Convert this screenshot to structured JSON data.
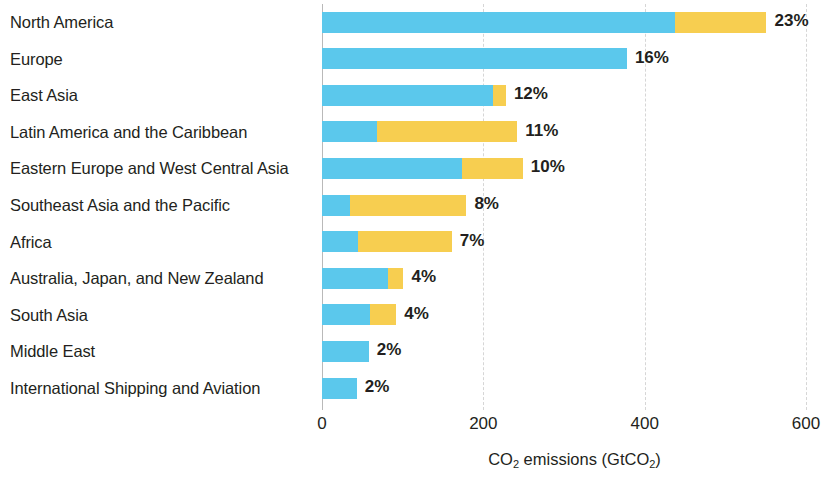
{
  "chart_data": {
    "type": "bar",
    "orientation": "horizontal",
    "stacked": true,
    "title": "",
    "xlabel": "CO2 emissions (GtCO2)",
    "xlabel_parts": {
      "pre": "CO",
      "sub1": "2",
      "mid": " emissions (GtCO",
      "sub2": "2",
      "post": ")"
    },
    "ylabel": "",
    "xlim": [
      0,
      600
    ],
    "xticks": [
      0,
      200,
      400,
      600
    ],
    "xtick_labels": [
      "0",
      "200",
      "400",
      "600"
    ],
    "grid": "vertical-dashed",
    "legend": "none",
    "categories": [
      "North America",
      "Europe",
      "East Asia",
      "Latin  America and the Caribbean",
      "Eastern Europe and West Central Asia",
      "Southeast Asia and the Pacific",
      "Africa",
      "Australia, Japan, and New Zealand",
      "South Asia",
      "Middle East",
      "International Shipping and Aviation"
    ],
    "series": [
      {
        "name": "segment-1",
        "color": "#5bc8ec",
        "values": [
          437,
          378,
          212,
          68,
          173,
          35,
          45,
          82,
          59,
          58,
          43
        ]
      },
      {
        "name": "segment-2",
        "color": "#f7ce50",
        "values": [
          114,
          0,
          16,
          174,
          76,
          144,
          116,
          19,
          33,
          0,
          0
        ]
      }
    ],
    "totals": [
      551,
      378,
      228,
      242,
      249,
      179,
      161,
      101,
      92,
      58,
      43
    ],
    "data_labels": [
      "23%",
      "16%",
      "12%",
      "11%",
      "10%",
      "8%",
      "7%",
      "4%",
      "4%",
      "2%",
      "2%"
    ]
  },
  "colors": {
    "segment_1": "#5bc8ec",
    "segment_2": "#f7ce50",
    "axis": "#b9b9b9",
    "gridline": "#d6d6d6",
    "text": "#231f20",
    "background": "#ffffff"
  }
}
